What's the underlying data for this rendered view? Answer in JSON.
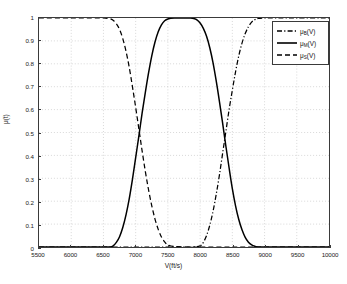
{
  "chart_data": {
    "type": "line",
    "title": "",
    "xlabel": "V(ft/s)",
    "ylabel": "μ(t)",
    "xlim": [
      5500,
      10000
    ],
    "ylim": [
      0,
      1
    ],
    "xticks": [
      5500,
      6000,
      6500,
      7000,
      7500,
      8000,
      8500,
      9000,
      9500,
      10000
    ],
    "xtick_labels": [
      "5500",
      "6000",
      "6500",
      "7000",
      "7500",
      "8000",
      "8500",
      "9000",
      "9500",
      "10000"
    ],
    "yticks": [
      0,
      0.1,
      0.2,
      0.3,
      0.4,
      0.5,
      0.6,
      0.7,
      0.8,
      0.9,
      1
    ],
    "ytick_labels": [
      "0",
      "0.1",
      "0.2",
      "0.3",
      "0.4",
      "0.5",
      "0.6",
      "0.7",
      "0.8",
      "0.9",
      "1"
    ],
    "grid": true,
    "legend_position": "upper right",
    "series": [
      {
        "name": "μB(V)",
        "label_base": "μ",
        "label_sub": "B",
        "label_tail": "(V)",
        "style": "dashdot",
        "color": "#000000",
        "x": [
          5500,
          6000,
          6500,
          7000,
          7400,
          7700,
          7900,
          8000,
          8050,
          8100,
          8150,
          8200,
          8250,
          8300,
          8350,
          8400,
          8450,
          8500,
          8550,
          8600,
          8650,
          8700,
          8750,
          8800,
          8850,
          8900,
          9000,
          9200,
          9500,
          10000
        ],
        "y": [
          0,
          0,
          0,
          0,
          0,
          0,
          0,
          0.005,
          0.02,
          0.05,
          0.095,
          0.155,
          0.23,
          0.315,
          0.41,
          0.505,
          0.6,
          0.685,
          0.765,
          0.835,
          0.89,
          0.932,
          0.962,
          0.982,
          0.993,
          0.998,
          1,
          1,
          1,
          1
        ]
      },
      {
        "name": "μM(V)",
        "label_base": "μ",
        "label_sub": "M",
        "label_tail": "(V)",
        "style": "solid",
        "color": "#000000",
        "x": [
          5500,
          6000,
          6400,
          6600,
          6650,
          6700,
          6750,
          6800,
          6850,
          6900,
          6950,
          7000,
          7050,
          7100,
          7150,
          7200,
          7250,
          7300,
          7350,
          7400,
          7450,
          7500,
          7600,
          7700,
          7800,
          7850,
          7900,
          7950,
          8000,
          8050,
          8100,
          8150,
          8200,
          8250,
          8300,
          8350,
          8400,
          8450,
          8500,
          8550,
          8600,
          8650,
          8700,
          8750,
          8800,
          8850,
          8900,
          9200,
          9600,
          10000
        ],
        "y": [
          0,
          0,
          0,
          0,
          0.005,
          0.02,
          0.045,
          0.085,
          0.14,
          0.21,
          0.295,
          0.39,
          0.485,
          0.585,
          0.675,
          0.76,
          0.835,
          0.895,
          0.94,
          0.97,
          0.988,
          0.996,
          1,
          1,
          1,
          1,
          0.998,
          0.992,
          0.978,
          0.955,
          0.92,
          0.87,
          0.805,
          0.725,
          0.635,
          0.54,
          0.44,
          0.345,
          0.255,
          0.18,
          0.12,
          0.075,
          0.042,
          0.021,
          0.009,
          0.003,
          0,
          0,
          0,
          0
        ]
      },
      {
        "name": "μS(V)",
        "label_base": "μ",
        "label_sub": "S",
        "label_tail": "(V)",
        "style": "dashed",
        "color": "#000000",
        "x": [
          5500,
          6000,
          6300,
          6500,
          6600,
          6650,
          6700,
          6750,
          6800,
          6850,
          6900,
          6950,
          7000,
          7050,
          7100,
          7150,
          7200,
          7250,
          7300,
          7350,
          7400,
          7450,
          7500,
          7600,
          7800,
          8000,
          8500,
          9000,
          9500,
          10000
        ],
        "y": [
          1,
          1,
          1,
          1,
          0.997,
          0.99,
          0.975,
          0.95,
          0.91,
          0.855,
          0.785,
          0.7,
          0.61,
          0.515,
          0.42,
          0.33,
          0.25,
          0.18,
          0.122,
          0.077,
          0.044,
          0.022,
          0.009,
          0.002,
          0,
          0,
          0,
          0,
          0,
          0
        ]
      }
    ],
    "annotations": []
  }
}
